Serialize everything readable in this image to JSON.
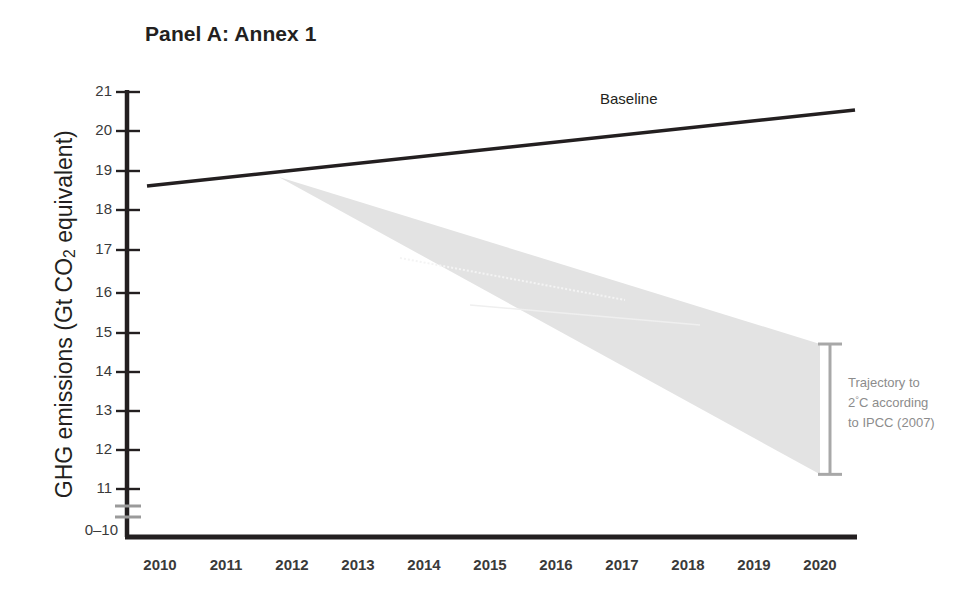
{
  "figure": {
    "title": "Panel A: Annex 1",
    "background": "#ffffff"
  },
  "axes": {
    "y_title_main": "GHG emissions (Gt CO",
    "y_title_sub": "2",
    "y_title_tail": " equivalent)",
    "y_title_full": "GHG emissions (Gt CO2 equivalent)",
    "y_ticks": [
      "21",
      "20",
      "19",
      "18",
      "17",
      "16",
      "15",
      "14",
      "13",
      "12",
      "11"
    ],
    "y_break_label": "0–10",
    "x_ticks": [
      "2010",
      "2011",
      "2012",
      "2013",
      "2014",
      "2015",
      "2016",
      "2017",
      "2018",
      "2019",
      "2020"
    ]
  },
  "labels": {
    "baseline": "Baseline",
    "trajectory_line1": "Trajectory to",
    "trajectory_line2_pre": "2",
    "trajectory_line2_deg": "°",
    "trajectory_line2_post": "C according",
    "trajectory_line3": "to IPCC (2007)"
  },
  "colors": {
    "baseline_line": "#231f20",
    "axis": "#231f20",
    "wedge_fill": "#e3e3e3",
    "bracket": "#a8a8a8",
    "break_mark": "#9a9a9a",
    "annotation_text": "#8c8c8c",
    "tick_text": "#3a3a3a"
  },
  "chart_data": {
    "type": "line",
    "title": "Panel A: Annex 1",
    "xlabel": "",
    "ylabel": "GHG emissions (Gt CO2 equivalent)",
    "xlim": [
      2010,
      2020.5
    ],
    "ylim": [
      10.5,
      21
    ],
    "ytick_values": [
      21,
      20,
      19,
      18,
      17,
      16,
      15,
      14,
      13,
      12,
      11
    ],
    "axis_break": "y-axis broken below 11; bottom label reads 0-10",
    "grid": false,
    "legend": "inline annotations",
    "x": [
      2010,
      2011,
      2012,
      2013,
      2014,
      2015,
      2016,
      2017,
      2018,
      2019,
      2020
    ],
    "series": [
      {
        "name": "Baseline",
        "type": "line",
        "values": [
          18.62,
          18.81,
          19.0,
          19.19,
          19.38,
          19.57,
          19.76,
          19.95,
          20.14,
          20.33,
          20.52
        ]
      },
      {
        "name": "Trajectory to 2C according to IPCC (2007) - upper bound",
        "type": "band_upper",
        "values": [
          null,
          null,
          18.85,
          18.42,
          17.99,
          17.57,
          17.14,
          16.71,
          16.28,
          15.86,
          14.62
        ]
      },
      {
        "name": "Trajectory to 2C according to IPCC (2007) - lower bound",
        "type": "band_lower",
        "values": [
          null,
          null,
          18.85,
          18.12,
          17.38,
          16.65,
          15.92,
          15.19,
          14.45,
          13.72,
          11.32
        ]
      }
    ],
    "band": {
      "name": "Trajectory to 2C according to IPCC (2007)",
      "apex_year": 2011.8,
      "apex_value": 18.85,
      "end_year": 2020,
      "end_upper": 14.62,
      "end_lower": 11.32,
      "fill": "#e3e3e3"
    },
    "annotations": [
      {
        "text": "Baseline",
        "x": 2016.7,
        "y": 20.6
      },
      {
        "text": "Trajectory to 2C according to IPCC (2007)",
        "x": 2020.4,
        "y": 13.0
      }
    ]
  }
}
